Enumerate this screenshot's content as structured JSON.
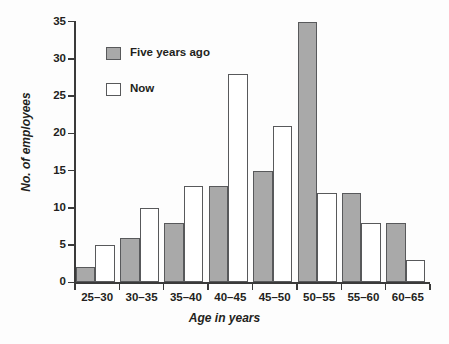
{
  "chart_data": {
    "type": "bar",
    "title": "",
    "subtitle": "",
    "xlabel": "Age in years",
    "ylabel": "No. of employees",
    "categories": [
      "25–30",
      "30–35",
      "35–40",
      "40–45",
      "45–50",
      "50–55",
      "55–60",
      "60–65"
    ],
    "series": [
      {
        "name": "Five years ago",
        "color": "#a9a9a9",
        "values": [
          2,
          6,
          8,
          13,
          15,
          35,
          12,
          8
        ]
      },
      {
        "name": "Now",
        "color": "#ffffff",
        "values": [
          5,
          10,
          13,
          28,
          21,
          12,
          8,
          3
        ]
      }
    ],
    "ylim": [
      0,
      35
    ],
    "yticks": [
      0,
      5,
      10,
      15,
      20,
      25,
      30,
      35
    ],
    "ytick_labels": [
      "0",
      "5",
      "10",
      "15",
      "20",
      "25",
      "30",
      "35"
    ],
    "grid": false,
    "legend_position": "upper-left-inside",
    "axis_color": "#3a3a3a",
    "bar_edge_color": "#58595b",
    "background_color": "#fdfdfd"
  },
  "legend": {
    "items": [
      {
        "label": "Five years ago",
        "swatch": "past"
      },
      {
        "label": "Now",
        "swatch": "now"
      }
    ]
  }
}
